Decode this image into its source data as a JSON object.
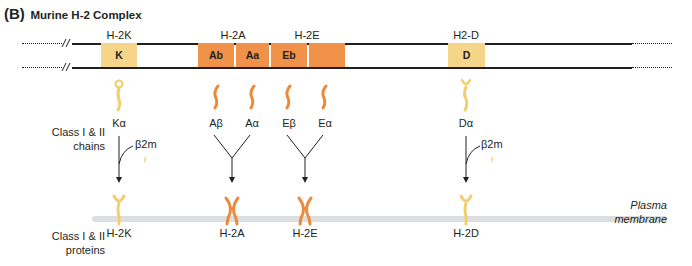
{
  "title": {
    "tag": "(B)",
    "text": "Murine H-2 Complex"
  },
  "loci": [
    {
      "label": "H-2K",
      "x": 119
    },
    {
      "label": "H-2A",
      "x": 233
    },
    {
      "label": "H-2E",
      "x": 307
    },
    {
      "label": "H2-D",
      "x": 466
    }
  ],
  "genes": [
    {
      "label": "K",
      "class": "I",
      "color": "#f4d58a"
    },
    {
      "label": "Ab",
      "class": "II",
      "color": "#f0924a"
    },
    {
      "label": "Aa",
      "class": "II",
      "color": "#f0924a"
    },
    {
      "label": "Eb",
      "class": "II",
      "color": "#f0924a"
    },
    {
      "label": "",
      "class": "II",
      "color": "#f0924a"
    },
    {
      "label": "D",
      "class": "I",
      "color": "#f4d58a"
    }
  ],
  "side_labels": {
    "chains": [
      "Class I & II",
      "chains"
    ],
    "proteins": [
      "Class I & II",
      "proteins"
    ]
  },
  "chains": [
    {
      "label": "Kα",
      "type": "class1"
    },
    {
      "label": "Aβ",
      "type": "class2"
    },
    {
      "label": "Aα",
      "type": "class2"
    },
    {
      "label": "Eβ",
      "type": "class2"
    },
    {
      "label": "Eα",
      "type": "class2"
    },
    {
      "label": "Dα",
      "type": "class1"
    }
  ],
  "beta2m_label": "β2m",
  "proteins": [
    {
      "label": "H-2K",
      "type": "class1"
    },
    {
      "label": "H-2A",
      "type": "class2"
    },
    {
      "label": "H-2E",
      "type": "class2"
    },
    {
      "label": "H-2D",
      "type": "class1"
    }
  ],
  "membrane": {
    "label_line1": "Plasma",
    "label_line2": "membrane"
  },
  "colors": {
    "class1": "#f4d58a",
    "class1_chain": "#f2cf6e",
    "class2": "#f0924a",
    "class2_chain": "#ec8a3c",
    "membrane": "#dcdedf",
    "line": "#231f20"
  }
}
